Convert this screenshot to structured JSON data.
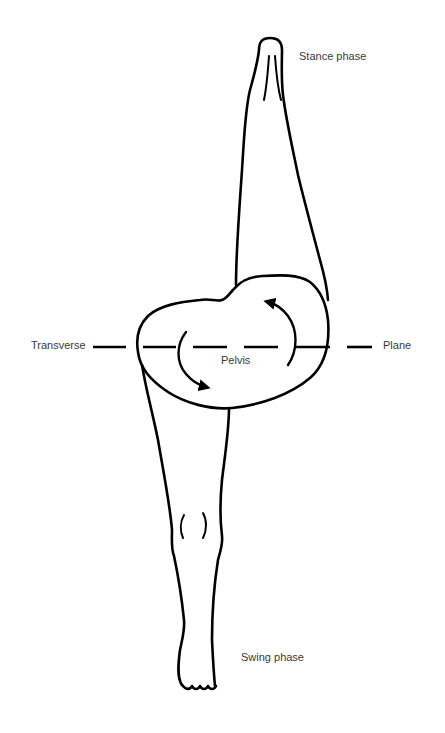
{
  "diagram": {
    "type": "anatomical-line-drawing",
    "labels": {
      "stance": "Stance phase",
      "transverse": "Transverse",
      "plane": "Plane",
      "pelvis": "Pelvis",
      "swing": "Swing phase"
    },
    "elements": [
      {
        "name": "stance-leg",
        "position": "upper, pointing up",
        "label": "Stance phase"
      },
      {
        "name": "pelvis",
        "position": "center",
        "label": "Pelvis"
      },
      {
        "name": "swing-leg",
        "position": "lower, pointing down, with knee marks and toes",
        "label": "Swing phase"
      },
      {
        "name": "transverse-plane-line",
        "style": "dashed horizontal",
        "label_left": "Transverse",
        "label_right": "Plane"
      },
      {
        "name": "rotation-arrows",
        "count": 2,
        "direction": "counter-rotating arcs about the pelvis"
      }
    ],
    "colors": {
      "stroke": "#000000",
      "text": "#3a3a3a",
      "background": "#ffffff"
    }
  }
}
